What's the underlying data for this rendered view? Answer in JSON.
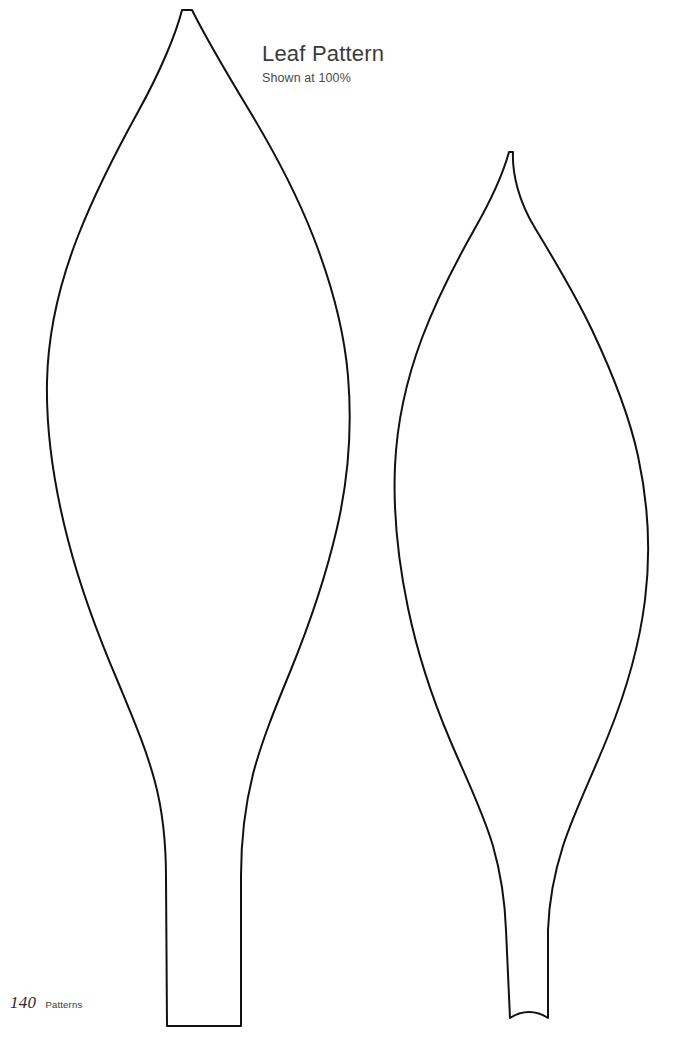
{
  "page": {
    "background_color": "#ffffff",
    "width": 691,
    "height": 1039
  },
  "caption": {
    "title": "Leaf Pattern",
    "subtitle": "Shown at 100%"
  },
  "footer": {
    "page_number": "140",
    "section_label": "Patterns"
  },
  "artwork": {
    "stroke_color": "#111111",
    "fill_color": "#ffffff",
    "stroke_width": 2,
    "shapes": [
      {
        "name": "large-leaf-outline",
        "description": "Large pointed leaf template with long tapered stem, left side of page",
        "tip": [
          182,
          10
        ],
        "widest_span": [
          47,
          348
        ],
        "widest_y": 430,
        "stem_bottom": [
          167,
          241
        ],
        "stem_bottom_y": 1026,
        "path": "M 182 10 C 176 34 160 72 139 110 C 118 148 96 190 78 236 C 60 282 48 330 47 382 C 46 434 54 486 68 540 C 82 594 100 640 118 682 C 132 716 146 748 155 782 C 163 812 166 846 166 878 L 167 1026 L 241 1026 L 241 876 C 241 842 245 806 253 774 C 262 740 276 706 290 672 C 308 628 325 580 337 528 C 349 476 352 424 348 376 C 344 328 331 282 313 236 C 295 190 272 148 249 110 C 226 72 204 34 192 10 Z"
      },
      {
        "name": "small-leaf-outline",
        "description": "Second pointed leaf template, slightly smaller and narrower, right side of page",
        "tip": [
          509,
          152
        ],
        "widest_span": [
          395,
          645
        ],
        "widest_y": 560,
        "stem_bottom": [
          510,
          578
        ],
        "stem_bottom_y": 1022,
        "path": "M 509 152 C 503 174 490 202 474 230 C 456 262 437 298 422 338 C 407 378 397 420 395 466 C 393 512 398 560 408 608 C 418 656 433 700 450 740 C 466 778 483 812 493 846 C 501 874 505 902 506 930 L 510 1018 C 522 1010 536 1010 548 1018 L 548 930 C 549 902 554 874 563 846 C 574 812 592 776 608 736 C 625 694 639 648 645 600 C 651 552 648 502 638 456 C 628 410 610 368 592 330 C 574 292 553 258 535 228 C 519 202 512 174 513 152 Z"
      }
    ]
  }
}
